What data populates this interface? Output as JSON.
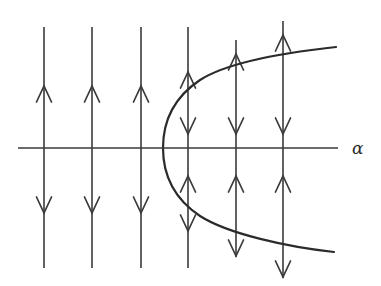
{
  "figure": {
    "kind": "bifurcation-diagram",
    "caption_label": "saddle-node bifurcation phase portrait",
    "background_color": "#ffffff",
    "stroke_color": "#3a3a3a",
    "curve_color": "#2b2b2b",
    "axis": {
      "name": "alpha-axis",
      "label": "α",
      "label_x": 352,
      "label_y": 140,
      "x_start": 18,
      "x_end": 338,
      "y": 148,
      "stroke_width": 1.6
    },
    "curve": {
      "name": "parabola-branches",
      "description": "rightward opening parabola, fixed point locus",
      "vertex_x": 163,
      "vertex_y": 148,
      "upper_end_x": 336,
      "upper_end_y": 47,
      "lower_end_x": 334,
      "lower_end_y": 252,
      "stroke_width": 2.2,
      "upper_path": "M 163 148 C 163 118 176 96 200 80 C 228 62 290 52 336 47",
      "lower_path": "M 163 148 C 163 178 176 200 200 216 C 228 234 288 247 334 252"
    },
    "trajectories": [
      {
        "name": "flow-line-1",
        "x": 44,
        "y_top": 27,
        "y_bottom": 268,
        "arrows": [
          {
            "name": "arrow-up-1",
            "y": 86,
            "dir": "up"
          },
          {
            "name": "arrow-down-1",
            "y": 213,
            "dir": "down"
          }
        ]
      },
      {
        "name": "flow-line-2",
        "x": 92,
        "y_top": 27,
        "y_bottom": 268,
        "arrows": [
          {
            "name": "arrow-up-2",
            "y": 86,
            "dir": "up"
          },
          {
            "name": "arrow-down-2",
            "y": 213,
            "dir": "down"
          }
        ]
      },
      {
        "name": "flow-line-3",
        "x": 141,
        "y_top": 27,
        "y_bottom": 268,
        "arrows": [
          {
            "name": "arrow-up-3",
            "y": 86,
            "dir": "up"
          },
          {
            "name": "arrow-down-3",
            "y": 213,
            "dir": "down"
          }
        ]
      },
      {
        "name": "flow-line-4",
        "x": 188,
        "y_top": 27,
        "y_bottom": 268,
        "arrows": [
          {
            "name": "arrow-up-4a",
            "y": 72,
            "dir": "up"
          },
          {
            "name": "arrow-down-4a",
            "y": 134,
            "dir": "down"
          },
          {
            "name": "arrow-up-4b",
            "y": 176,
            "dir": "up"
          },
          {
            "name": "arrow-down-4b",
            "y": 231,
            "dir": "down"
          }
        ]
      },
      {
        "name": "flow-line-5",
        "x": 236,
        "y_top": 40,
        "y_bottom": 257,
        "arrows": [
          {
            "name": "arrow-up-5a",
            "y": 54,
            "dir": "up"
          },
          {
            "name": "arrow-down-5a",
            "y": 134,
            "dir": "down"
          },
          {
            "name": "arrow-up-5b",
            "y": 176,
            "dir": "up"
          },
          {
            "name": "arrow-down-5b",
            "y": 256,
            "dir": "down"
          }
        ]
      },
      {
        "name": "flow-line-6",
        "x": 283,
        "y_top": 21,
        "y_bottom": 278,
        "arrows": [
          {
            "name": "arrow-up-6a",
            "y": 35,
            "dir": "up"
          },
          {
            "name": "arrow-down-6a",
            "y": 134,
            "dir": "down"
          },
          {
            "name": "arrow-up-6b",
            "y": 176,
            "dir": "up"
          },
          {
            "name": "arrow-down-6b",
            "y": 277,
            "dir": "down"
          }
        ]
      }
    ]
  }
}
